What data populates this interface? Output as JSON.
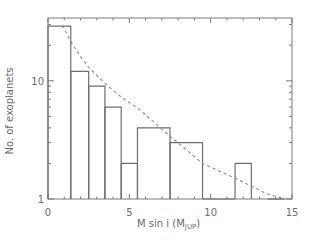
{
  "chart_data": {
    "type": "bar",
    "style": "step-histogram",
    "title": "",
    "xlabel": "M sin i (M",
    "xlabel_sub": "JUP",
    "xlabel_close": ")",
    "ylabel": "No. of exoplanets",
    "xlim": [
      0,
      15
    ],
    "ylim": [
      1,
      34
    ],
    "yscale": "log",
    "x_ticks": [
      0,
      5,
      10,
      15
    ],
    "x_tick_labels": [
      "0",
      "5",
      "10",
      "15"
    ],
    "y_ticks": [
      1,
      10
    ],
    "y_tick_labels": [
      "1",
      "10"
    ],
    "grid": false,
    "bins": [
      {
        "from": 0.0,
        "to": 1.4,
        "count": 29
      },
      {
        "from": 1.4,
        "to": 2.5,
        "count": 12
      },
      {
        "from": 2.5,
        "to": 3.5,
        "count": 9
      },
      {
        "from": 3.5,
        "to": 4.5,
        "count": 6
      },
      {
        "from": 4.5,
        "to": 5.5,
        "count": 2
      },
      {
        "from": 5.5,
        "to": 7.5,
        "count": 4
      },
      {
        "from": 7.5,
        "to": 9.5,
        "count": 3
      },
      {
        "from": 9.5,
        "to": 11.5,
        "count": 1
      },
      {
        "from": 11.5,
        "to": 12.5,
        "count": 2
      },
      {
        "from": 12.5,
        "to": 13.5,
        "count": 0
      },
      {
        "from": 13.5,
        "to": 14.5,
        "count": 1
      }
    ],
    "fit_curve": {
      "name": "fit",
      "style": "dashed",
      "x": [
        0.9,
        1.35,
        2.0,
        2.5,
        3.5,
        4.5,
        5.5,
        7.5,
        9.5,
        11.5,
        13.5,
        14.6
      ],
      "y": [
        29.5,
        22,
        16,
        13,
        9.5,
        7.3,
        5.9,
        3.4,
        2.0,
        1.5,
        1.1,
        1.0
      ]
    }
  }
}
